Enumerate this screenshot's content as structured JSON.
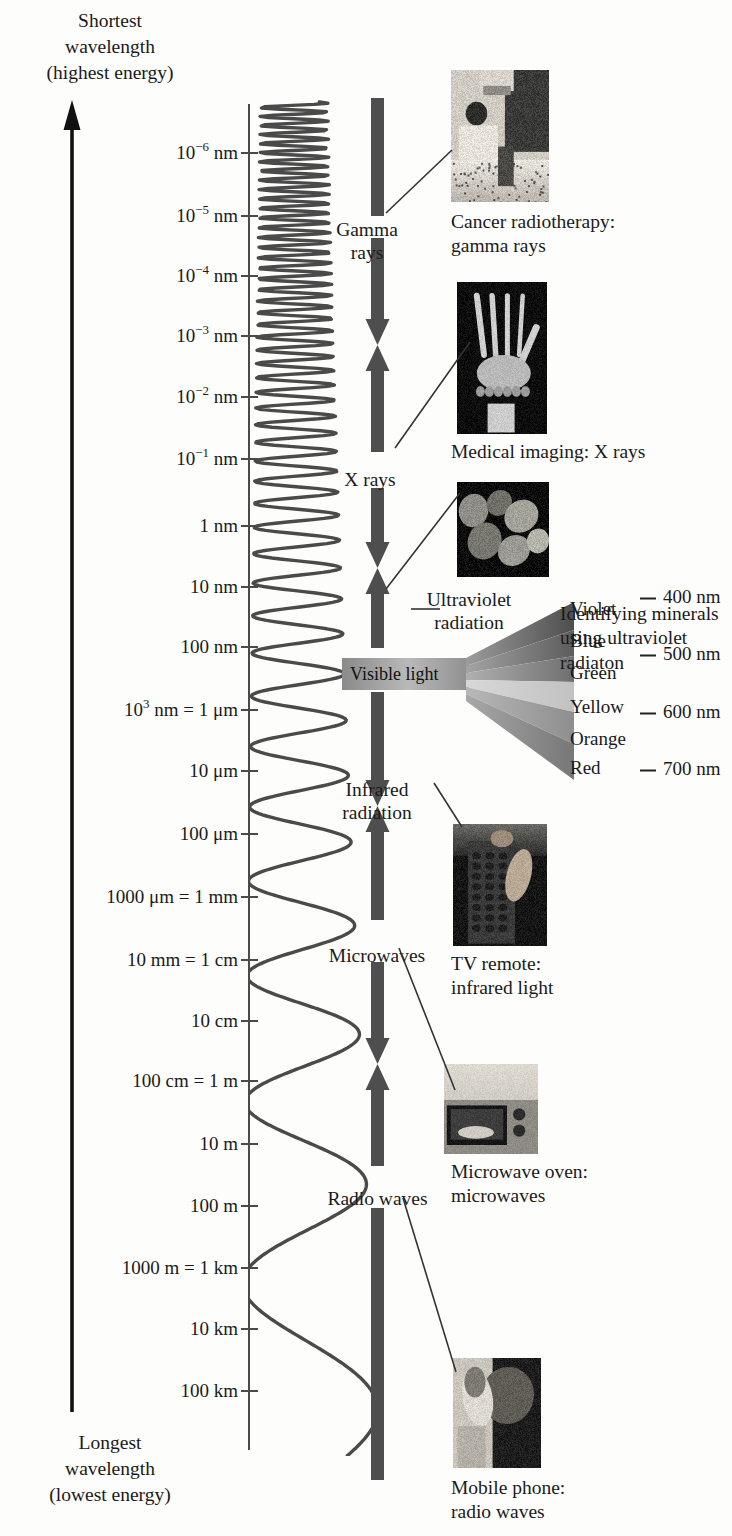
{
  "figure": {
    "top_caption": "Shortest\nwavelength\n(highest energy)",
    "bottom_caption": "Longest\nwavelength\n(lowest energy)",
    "energy_arrow_direction": "up"
  },
  "chart_data": {
    "type": "table",
    "ylabel": "Wavelength",
    "axis_orientation": "vertical, logarithmic, shortest wavelength at top",
    "tick_labels": [
      "10^-6 nm",
      "10^-5 nm",
      "10^-4 nm",
      "10^-3 nm",
      "10^-2 nm",
      "10^-1 nm",
      "1 nm",
      "10 nm",
      "100 nm",
      "10^3 nm = 1 um",
      "10 um",
      "100 um",
      "1000 um = 1 mm",
      "10 mm = 1 cm",
      "10 cm",
      "100 cm = 1 m",
      "10 m",
      "100 m",
      "1000 m = 1 km",
      "10 km",
      "100 km"
    ],
    "categories": [
      "Gamma rays",
      "X rays",
      "Ultraviolet radiation",
      "Visible light",
      "Infrared radiation",
      "Microwaves",
      "Radio waves"
    ],
    "visible_spectrum_colors": [
      "Violet",
      "Blue",
      "Green",
      "Yellow",
      "Orange",
      "Red"
    ],
    "visible_spectrum_wavelengths": [
      "400 nm",
      "500 nm",
      "600 nm",
      "700 nm"
    ]
  },
  "axis": {
    "ticks": [
      {
        "label_html": "10<sup>−6</sup> nm",
        "y": 152
      },
      {
        "label_html": "10<sup>−5</sup> nm",
        "y": 215
      },
      {
        "label_html": "10<sup>−4</sup> nm",
        "y": 275
      },
      {
        "label_html": "10<sup>−3</sup> nm",
        "y": 335
      },
      {
        "label_html": "10<sup>−2</sup> nm",
        "y": 396
      },
      {
        "label_html": "10<sup>−1</sup> nm",
        "y": 458
      },
      {
        "label_html": "1 nm",
        "y": 525
      },
      {
        "label_html": "10 nm",
        "y": 586
      },
      {
        "label_html": "100 nm",
        "y": 646
      },
      {
        "label_html": "10<sup>3</sup> nm = 1 μm",
        "y": 709
      },
      {
        "label_html": "10 μm",
        "y": 770
      },
      {
        "label_html": "100 μm",
        "y": 833
      },
      {
        "label_html": "1000 μm = 1 mm",
        "y": 896
      },
      {
        "label_html": "10 mm = 1 cm",
        "y": 959
      },
      {
        "label_html": "10 cm",
        "y": 1020
      },
      {
        "label_html": "100 cm = 1 m",
        "y": 1080
      },
      {
        "label_html": "10 m",
        "y": 1143
      },
      {
        "label_html": "100 m",
        "y": 1205
      },
      {
        "label_html": "1000 m = 1 km",
        "y": 1267
      },
      {
        "label_html": "10 km",
        "y": 1328
      },
      {
        "label_html": "100 km",
        "y": 1390
      }
    ]
  },
  "bands": [
    {
      "name": "gamma-rays",
      "label": "Gamma\nrays",
      "label_x": 312,
      "label_y": 218,
      "label_w": 110
    },
    {
      "name": "x-rays",
      "label": "X rays",
      "label_x": 325,
      "label_y": 468,
      "label_w": 90
    },
    {
      "name": "ultraviolet",
      "label": "Ultraviolet\nradiation",
      "label_x": 404,
      "label_y": 588,
      "label_w": 130
    },
    {
      "name": "visible-light",
      "label": "Visible light",
      "label_x": 350,
      "label_y": 666,
      "label_w": 120
    },
    {
      "name": "infrared",
      "label": "Infrared\nradiation",
      "label_x": 318,
      "label_y": 778,
      "label_w": 118
    },
    {
      "name": "microwaves",
      "label": "Microwaves",
      "label_x": 312,
      "label_y": 944,
      "label_w": 130
    },
    {
      "name": "radio-waves",
      "label": "Radio waves",
      "label_x": 310,
      "label_y": 1187,
      "label_w": 135
    }
  ],
  "visible": {
    "bar_label": "Visible light",
    "colors": [
      {
        "name": "Violet",
        "y": 608,
        "swatch": "#7a5fa8"
      },
      {
        "name": "Blue",
        "y": 640,
        "swatch": "#4a63a8"
      },
      {
        "name": "Green",
        "y": 672,
        "swatch": "#5f9a62"
      },
      {
        "name": "Yellow",
        "y": 706,
        "swatch": "#d8c96a"
      },
      {
        "name": "Orange",
        "y": 738,
        "swatch": "#c98a4a"
      },
      {
        "name": "Red",
        "y": 767,
        "swatch": "#b04a42"
      }
    ],
    "nm_marks": [
      {
        "label": "400 nm",
        "y": 596
      },
      {
        "label": "500 nm",
        "y": 653
      },
      {
        "label": "600 nm",
        "y": 711
      },
      {
        "label": "700 nm",
        "y": 768
      }
    ]
  },
  "photos": [
    {
      "name": "cancer-radiotherapy-photo",
      "alt": "Patient receiving cancer radiotherapy treatment",
      "caption": "Cancer radiotherapy:\ngamma rays",
      "x": 451,
      "y": 70,
      "w": 98,
      "h": 132,
      "cx": 451,
      "cy": 210,
      "kind": "radiotherapy"
    },
    {
      "name": "medical-imaging-photo",
      "alt": "X ray of a human hand",
      "caption": "Medical imaging: X rays",
      "x": 457,
      "y": 282,
      "w": 90,
      "h": 152,
      "cx": 451,
      "cy": 440,
      "kind": "xray"
    },
    {
      "name": "minerals-uv-photo",
      "alt": "Fluorescent minerals under ultraviolet light",
      "caption": "Identifying minerals\nusing ultraviolet\nradiaton",
      "x": 457,
      "y": 482,
      "w": 92,
      "h": 95,
      "cx": 560,
      "cy": 602,
      "kind": "minerals"
    },
    {
      "name": "tv-remote-photo",
      "alt": "Hand pressing buttons on a TV remote control",
      "caption": "TV remote:\ninfrared light",
      "x": 453,
      "y": 824,
      "w": 94,
      "h": 122,
      "cx": 451,
      "cy": 952,
      "kind": "remote"
    },
    {
      "name": "microwave-oven-photo",
      "alt": "Food inside a microwave oven",
      "caption": "Microwave oven:\nmicrowaves",
      "x": 444,
      "y": 1064,
      "w": 94,
      "h": 90,
      "cx": 451,
      "cy": 1160,
      "kind": "microwave"
    },
    {
      "name": "mobile-phone-photo",
      "alt": "Person using a mobile phone",
      "caption": "Mobile phone:\nradio waves",
      "x": 453,
      "y": 1358,
      "w": 88,
      "h": 110,
      "cx": 451,
      "cy": 1476,
      "kind": "phone"
    }
  ],
  "colors": {
    "ink": "#1a1a1a",
    "axis": "#4a4a4a",
    "band_bar": "#4e4e4e",
    "wave": "#4a4a4a",
    "paper": "#fdfdfb"
  }
}
